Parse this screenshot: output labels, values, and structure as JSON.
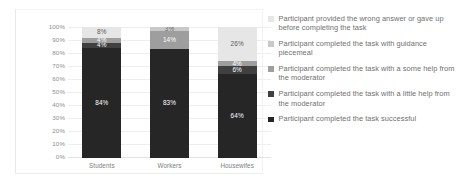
{
  "chart_data": {
    "type": "bar",
    "subtype": "100% stacked column",
    "title": "",
    "xlabel": "",
    "ylabel": "",
    "ylim": [
      0,
      100
    ],
    "grid": true,
    "legend_position": "right",
    "categories": [
      "Students",
      "Workers",
      "Housewifes"
    ],
    "ytick_labels": [
      "100%",
      "90%",
      "80%",
      "70%",
      "60%",
      "50%",
      "40%",
      "30%",
      "20%",
      "10%",
      "0%"
    ],
    "ytick_values": [
      100,
      90,
      80,
      70,
      60,
      50,
      40,
      30,
      20,
      10,
      0
    ],
    "series": [
      {
        "name": "Participant completed the task successful",
        "color": "#262626",
        "label_color": "#ffffff",
        "values": [
          84,
          83,
          64
        ],
        "labels": [
          "84%",
          "83%",
          "64%"
        ]
      },
      {
        "name": "Participant completed the task with a little help from the moderator",
        "color": "#404040",
        "label_color": "#ffffff",
        "values": [
          4,
          0,
          6
        ],
        "labels": [
          "4%",
          "",
          "6%"
        ]
      },
      {
        "name": "Participant completed the task with a some help from the moderator",
        "color": "#9e9e9e",
        "label_color": "#ffffff",
        "values": [
          4,
          14,
          4
        ],
        "labels": [
          "4%",
          "14%",
          "4%"
        ]
      },
      {
        "name": "Participant completed the task with guidance piecemeal",
        "color": "#c9c9c9",
        "label_color": "#6b6b6b",
        "values": [
          0,
          3,
          0
        ],
        "labels": [
          "",
          "3%",
          ""
        ]
      },
      {
        "name": "Participant provided the wrong answer or gave up before completing the task",
        "color": "#e6e6e6",
        "label_color": "#5a5a5a",
        "values": [
          8,
          0,
          26
        ],
        "labels": [
          "8%",
          "",
          "26%"
        ]
      }
    ]
  },
  "legend": {
    "items": [
      {
        "label": "Participant provided the wrong answer or gave up before completing the task",
        "color": "#e6e6e6"
      },
      {
        "label": "Participant completed the task with guidance piecemeal",
        "color": "#c9c9c9"
      },
      {
        "label": "Participant completed the task with a some help from the moderator",
        "color": "#9e9e9e"
      },
      {
        "label": "Participant completed the task with a little help from the moderator",
        "color": "#404040"
      },
      {
        "label": "Participant completed the task successful",
        "color": "#262626"
      }
    ]
  }
}
